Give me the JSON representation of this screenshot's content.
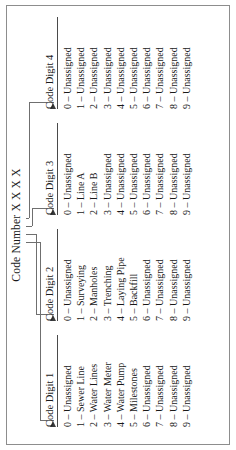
{
  "figure": {
    "title": "Code Number X X X X",
    "columns": [
      {
        "header": "Code Digit 1",
        "items": [
          "0 – Unassigned",
          "1 – Sewer Line",
          "2 – Water Lines",
          "3 – Water Meter",
          "4 – Water Pump",
          "5 – Milestones",
          "6 – Unassigned",
          "7 – Unassigned",
          "8 – Unassigned",
          "9 – Unassigned"
        ]
      },
      {
        "header": "Code Digit 2",
        "items": [
          "0 – Unassigned",
          "1 – Surveying",
          "2 – Manholes",
          "3 – Trenching",
          "4 – Laying Pipe",
          "5 – Backfill",
          "6 – Unassigned",
          "7 – Unassigned",
          "8 – Unassigned",
          "9 – Unassigned"
        ]
      },
      {
        "header": "Code Digit 3",
        "items": [
          "0 – Unassigned",
          "1 – Line A",
          "2 – Line B",
          "3 – Unassigned",
          "4 – Unassigned",
          "5 – Unassigned",
          "6 – Unassigned",
          "7 – Unassigned",
          "8 – Unassigned",
          "9 – Unassigned"
        ]
      },
      {
        "header": "Code Digit 4",
        "items": [
          "0 – Unassigned",
          "1 – Unassigned",
          "2 – Unassigned",
          "3 – Unassigned",
          "4 – Unassigned",
          "5 – Unassigned",
          "6 – Unassigned",
          "7 – Unassigned",
          "8 – Unassigned",
          "9 – Unassigned"
        ]
      }
    ]
  }
}
